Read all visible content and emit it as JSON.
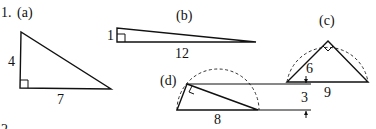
{
  "problem": {
    "number": "1.",
    "parts": [
      {
        "id": "a",
        "label": "(a)",
        "shape": "right-triangle",
        "sides": {
          "vertical_leg": "4",
          "horizontal_leg": "7"
        }
      },
      {
        "id": "b",
        "label": "(b)",
        "shape": "right-triangle",
        "sides": {
          "vertical_leg": "1",
          "horizontal_leg": "12"
        }
      },
      {
        "id": "c",
        "label": "(c)",
        "shape": "right-triangle-inscribed-in-semicircle",
        "sides": {
          "leg": "6",
          "hypotenuse": "9"
        }
      },
      {
        "id": "d",
        "label": "(d)",
        "shape": "right-triangle-inscribed-in-semicircle",
        "sides": {
          "hypotenuse": "8",
          "height": "3"
        }
      }
    ],
    "next_number": "2."
  }
}
